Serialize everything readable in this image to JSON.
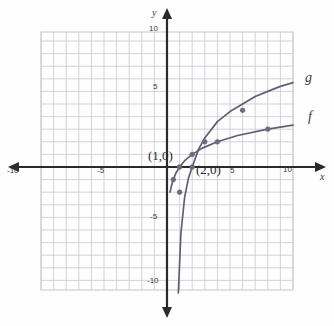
{
  "chart_data": {
    "type": "line",
    "title": "",
    "xlabel": "x",
    "ylabel": "y",
    "xlim": [
      -10,
      10
    ],
    "ylim": [
      -10,
      10
    ],
    "grid": true,
    "legend_position": "right-of-curves",
    "x_ticks": [
      -10,
      -5,
      5,
      10
    ],
    "y_ticks": [
      -10,
      -5,
      5,
      10
    ],
    "x_tick_labels": [
      "-10",
      "-5",
      "5",
      "10"
    ],
    "y_tick_labels": [
      "-10",
      "-5",
      "5",
      "10"
    ],
    "grid_step": 1,
    "series": [
      {
        "name": "f",
        "label": "f",
        "color": "#5f5f73",
        "x_intercept": 1,
        "marked_points": [
          {
            "x": 1,
            "y": 0
          },
          {
            "x": 0.5,
            "y": -1
          },
          {
            "x": 2,
            "y": 1
          },
          {
            "x": 4,
            "y": 2
          },
          {
            "x": 8,
            "y": 3
          }
        ],
        "x": [
          0.25,
          0.35,
          0.5,
          0.7,
          1,
          1.4,
          2,
          2.8,
          4,
          5.6,
          8,
          10
        ],
        "y": [
          -2.0,
          -1.5,
          -1.0,
          -0.5,
          0,
          0.5,
          1.0,
          1.5,
          2.0,
          2.5,
          3.0,
          3.32
        ]
      },
      {
        "name": "g",
        "label": "g",
        "color": "#5f5f73",
        "x_intercept": 2,
        "marked_points": [
          {
            "x": 2,
            "y": 0
          },
          {
            "x": 1,
            "y": -2
          },
          {
            "x": 3,
            "y": 2
          },
          {
            "x": 6,
            "y": 4.5
          }
        ],
        "x": [
          0.9,
          1.1,
          1.4,
          1.7,
          2,
          2.5,
          3,
          4,
          5,
          6,
          7,
          8,
          9,
          10
        ],
        "y": [
          -10.0,
          -5.3,
          -2.4,
          -0.9,
          0,
          1.4,
          2.3,
          3.6,
          4.4,
          5.0,
          5.6,
          6.0,
          6.4,
          6.7
        ]
      }
    ],
    "annotations": [
      {
        "text": "(1,0)",
        "x": 1,
        "y": 0
      },
      {
        "text": "(2,0)",
        "x": 2,
        "y": 0
      }
    ]
  },
  "axes": {
    "y_top_label": "10",
    "y_five_label": "5",
    "y_neg_five_label": "-5",
    "y_neg_ten_label": "-10",
    "x_left_label": "-10",
    "x_neg_five_label": "-5",
    "x_five_label": "5",
    "x_right_label": "10",
    "x_axis_name": "x",
    "y_axis_name": "y"
  },
  "curve_labels": {
    "upper": "g",
    "lower": "f"
  },
  "point_labels": {
    "first": "(1,0)",
    "second": "(2,0)"
  },
  "colors": {
    "grid": "#c8c8d0",
    "axis": "#2a2a2a",
    "curve": "#5f5f73",
    "point": "#6b6b80",
    "text": "#3a3a3a",
    "background": "#fefefe"
  }
}
